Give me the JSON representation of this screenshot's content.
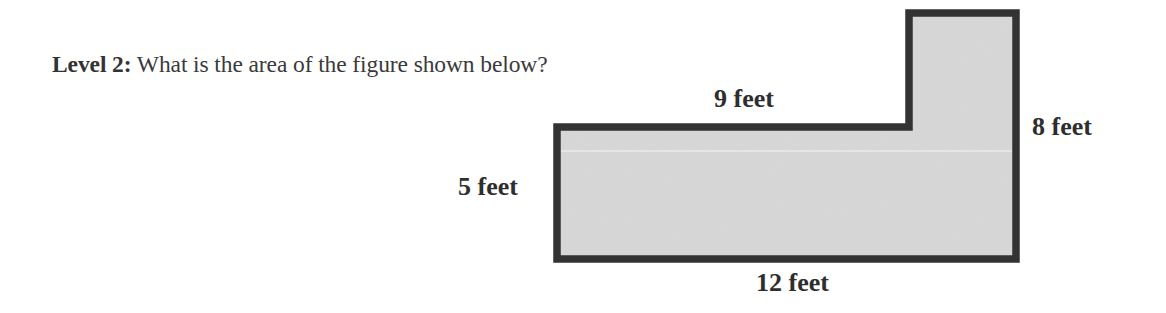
{
  "question": {
    "level_label": "Level 2:",
    "text": " What is the area of the figure shown below?"
  },
  "figure": {
    "shape": "L-shaped polygon",
    "fill_color": "#d8d8d8",
    "stroke_color": "#333333",
    "labels": {
      "top": "9 feet",
      "right": "8 feet",
      "left": "5 feet",
      "bottom": "12 feet"
    }
  }
}
